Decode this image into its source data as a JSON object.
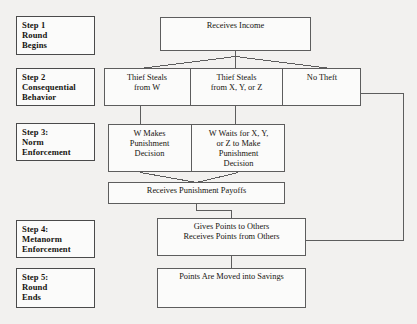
{
  "diagram": {
    "background_color": "#f2f1ef",
    "line_color": "#5d5d5d",
    "text_color": "#16140f"
  },
  "steps": [
    {
      "name": "step-1",
      "lines": [
        "Step 1",
        "Round",
        "Begins"
      ]
    },
    {
      "name": "step-2",
      "lines": [
        "Step 2",
        "Consequential",
        "Behavior"
      ]
    },
    {
      "name": "step-3",
      "lines": [
        "Step 3:",
        "Norm",
        "Enforcement"
      ]
    },
    {
      "name": "step-4",
      "lines": [
        "Step 4:",
        "Metanorm",
        "Enforcement"
      ]
    },
    {
      "name": "step-5",
      "lines": [
        "Step 5:",
        "Round",
        "Ends"
      ]
    }
  ],
  "nodes": {
    "receives_income": {
      "lines": [
        "Receives Income"
      ]
    },
    "thief_steals_w": {
      "lines": [
        "Thief Steals",
        "from W"
      ]
    },
    "thief_steals_xyz": {
      "lines": [
        "Thief Steals",
        "from X, Y, or Z"
      ]
    },
    "no_theft": {
      "lines": [
        "No Theft"
      ]
    },
    "w_makes_punishment": {
      "lines": [
        "W Makes",
        "Punishment",
        "Decision"
      ]
    },
    "w_waits_xyz": {
      "lines": [
        "W Waits for X, Y,",
        "or Z to Make",
        "Punishment",
        "Decision"
      ]
    },
    "receives_punishment_payoffs": {
      "lines": [
        "Receives Punishment Payoffs"
      ]
    },
    "gives_receives_points": {
      "lines": [
        "Gives Points to Others",
        "Receives Points from Others"
      ]
    },
    "points_moved_savings": {
      "lines": [
        "Points Are Moved into Savings"
      ]
    }
  },
  "flow": {
    "branches_from_income": [
      "Thief Steals from W",
      "Thief Steals from X, Y, or Z",
      "No Theft"
    ],
    "punishment_merge": [
      "W Makes Punishment Decision",
      "W Waits for X, Y, or Z to Make Punishment Decision"
    ],
    "no_theft_bypass_target": "Gives Points to Others / Receives Points from Others"
  }
}
